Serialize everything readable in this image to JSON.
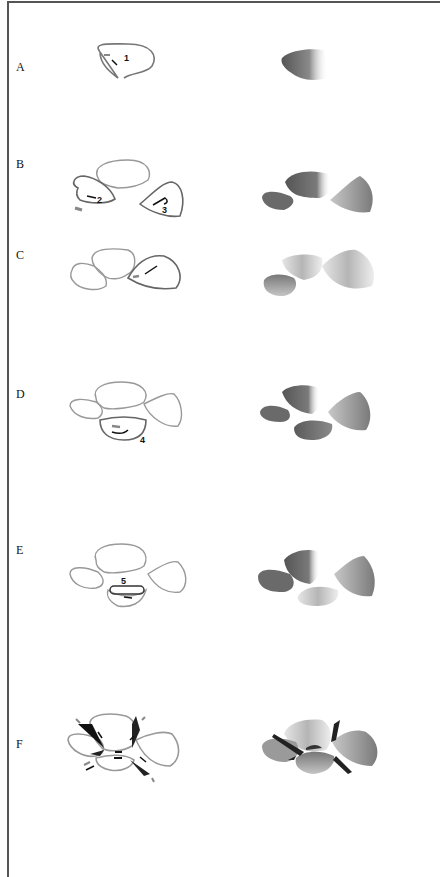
{
  "figure": {
    "rows": [
      {
        "label": "A",
        "sketch_numbers": [
          "1"
        ]
      },
      {
        "label": "B",
        "sketch_numbers": [
          "2",
          "3"
        ]
      },
      {
        "label": "C",
        "sketch_numbers": []
      },
      {
        "label": "D",
        "sketch_numbers": [
          "4"
        ]
      },
      {
        "label": "E",
        "sketch_numbers": [
          "5"
        ]
      },
      {
        "label": "F",
        "sketch_numbers": []
      }
    ],
    "colors": {
      "outline": "#8a8a8a",
      "outline_active": "#555555",
      "ink": "#111111",
      "shade_dark": "#5a5a5a",
      "shade_light": "#d8d8d8"
    }
  }
}
